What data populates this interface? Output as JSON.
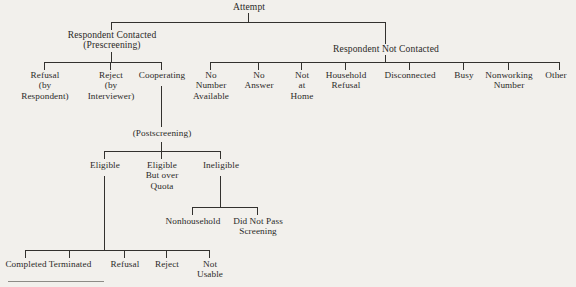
{
  "diagram": {
    "title": "Attempt",
    "type": "hierarchical-tree",
    "orientation": "top-down",
    "background_color": "#f2f0ec",
    "line_color": "#33312e",
    "text_color": "#2b2a28",
    "nodes": {
      "root": "Attempt",
      "contacted": "Respondent Contacted\n(Prescreening)",
      "not_contacted": "Respondent Not Contacted",
      "refusal_respondent": "Refusal\n(by\nRespondent)",
      "reject_interviewer": "Reject\n(by\nInterviewer)",
      "cooperating": "Cooperating",
      "no_number_available": "No\nNumber\nAvailable",
      "no_answer": "No\nAnswer",
      "not_at_home": "Not\nat\nHome",
      "household_refusal": "Household\nRefusal",
      "disconnected": "Disconnected",
      "busy": "Busy",
      "nonworking_number": "Nonworking\nNumber",
      "other": "Other",
      "postscreening": "(Postscreening)",
      "eligible": "Eligible",
      "eligible_over_quota": "Eligible\nBut over\nQuota",
      "ineligible": "Ineligible",
      "nonhousehold": "Nonhousehold",
      "did_not_pass_screening": "Did Not Pass\nScreening",
      "completed": "Completed",
      "terminated": "Terminated",
      "refusal": "Refusal",
      "reject": "Reject",
      "not_usable": "Not\nUsable"
    }
  }
}
